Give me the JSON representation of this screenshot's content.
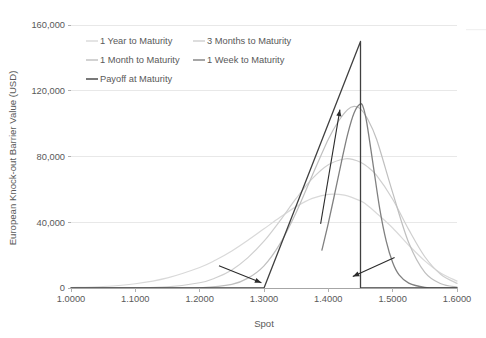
{
  "chart_data": {
    "type": "line",
    "title": "",
    "xlabel": "Spot",
    "ylabel": "European Knock-out Barrier Value (USD)",
    "xlim": [
      1.0,
      1.6
    ],
    "ylim": [
      0,
      160000
    ],
    "xticks": [
      "1.0000",
      "1.1000",
      "1.2000",
      "1.3000",
      "1.4000",
      "1.5000",
      "1.6000"
    ],
    "xtick_values": [
      1.0,
      1.1,
      1.2,
      1.3,
      1.4,
      1.5,
      1.6
    ],
    "yticks": [
      "0",
      "40,000",
      "80,000",
      "120,000",
      "160,000"
    ],
    "ytick_values": [
      0,
      40000,
      80000,
      120000,
      160000
    ],
    "grid": "horizontal",
    "legend_position": "top-left-inside",
    "barrier_spot": 1.45,
    "strike_spot": 1.3,
    "series": [
      {
        "name": "1 Year to Maturity",
        "color": "#d9d9d9",
        "width": 1.2,
        "x": [
          1.0,
          1.05,
          1.1,
          1.15,
          1.2,
          1.225,
          1.25,
          1.275,
          1.3,
          1.325,
          1.35,
          1.375,
          1.4,
          1.425,
          1.45,
          1.46,
          1.475,
          1.5,
          1.525,
          1.55,
          1.575,
          1.6
        ],
        "values": [
          250,
          900,
          2600,
          6200,
          12500,
          17000,
          22500,
          29000,
          36000,
          43000,
          49500,
          54500,
          57000,
          56500,
          53000,
          50500,
          45500,
          36500,
          26000,
          16500,
          9000,
          4200
        ]
      },
      {
        "name": "3 Months to Maturity",
        "color": "#cfcfcf",
        "width": 1.2,
        "x": [
          1.0,
          1.1,
          1.15,
          1.2,
          1.225,
          1.25,
          1.275,
          1.3,
          1.325,
          1.35,
          1.375,
          1.4,
          1.425,
          1.44,
          1.45,
          1.46,
          1.475,
          1.5,
          1.525,
          1.55,
          1.575,
          1.6
        ],
        "values": [
          0,
          120,
          700,
          3200,
          6200,
          11000,
          18500,
          28500,
          41000,
          54500,
          66500,
          75000,
          78500,
          78000,
          76500,
          74000,
          68500,
          54000,
          35500,
          19000,
          8200,
          2800
        ]
      },
      {
        "name": "1 Month to Maturity",
        "color": "#bfbfbf",
        "width": 1.2,
        "x": [
          1.0,
          1.15,
          1.2,
          1.25,
          1.275,
          1.3,
          1.325,
          1.35,
          1.375,
          1.4,
          1.415,
          1.43,
          1.44,
          1.45,
          1.46,
          1.475,
          1.5,
          1.525,
          1.55,
          1.575,
          1.6
        ],
        "values": [
          0,
          0,
          120,
          2200,
          6000,
          13500,
          27000,
          46000,
          68500,
          90500,
          101000,
          108500,
          110500,
          109000,
          103500,
          90500,
          58000,
          27500,
          9500,
          2600,
          600
        ]
      },
      {
        "name": "1 Week to Maturity",
        "color": "#808080",
        "width": 1.3,
        "x": [
          1.39,
          1.4,
          1.41,
          1.42,
          1.43,
          1.44,
          1.45,
          1.455,
          1.46,
          1.47,
          1.48,
          1.49,
          1.5,
          1.51,
          1.525,
          1.55,
          1.575,
          1.6
        ],
        "values": [
          23000,
          39500,
          57500,
          76000,
          93500,
          106500,
          112000,
          109000,
          100000,
          74000,
          48000,
          28500,
          15500,
          8000,
          3000,
          400,
          40,
          0
        ]
      },
      {
        "name": "Payoff at Maturity",
        "color": "#404040",
        "width": 1.3,
        "x": [
          1.0,
          1.3,
          1.45,
          1.45,
          1.6
        ],
        "values": [
          0,
          0,
          150000,
          0,
          0
        ]
      }
    ],
    "legend": [
      {
        "label": "1 Year to Maturity",
        "color": "#d9d9d9",
        "column": 1,
        "row": 1
      },
      {
        "label": "3 Months to Maturity",
        "color": "#cfcfcf",
        "column": 2,
        "row": 1
      },
      {
        "label": "1 Month to Maturity",
        "color": "#bfbfbf",
        "column": 1,
        "row": 2
      },
      {
        "label": "1 Week to Maturity",
        "color": "#808080",
        "column": 2,
        "row": 2
      },
      {
        "label": "Payoff at Maturity",
        "color": "#404040",
        "column": 1,
        "row": 3
      }
    ],
    "annotations": [
      {
        "name": "arrow-lower-left",
        "from_x": 1.23,
        "from_y": 13500,
        "to_x": 1.296,
        "to_y": 3200,
        "direction": "down-right"
      },
      {
        "name": "arrow-center-up",
        "from_x": 1.388,
        "from_y": 39000,
        "to_x": 1.418,
        "to_y": 108500,
        "direction": "up-right"
      },
      {
        "name": "arrow-lower-right",
        "from_x": 1.503,
        "from_y": 18500,
        "to_x": 1.438,
        "to_y": 7000,
        "direction": "down-left"
      }
    ]
  },
  "axis": {
    "y_title": "European Knock-out Barrier Value (USD)",
    "x_title": "Spot"
  }
}
